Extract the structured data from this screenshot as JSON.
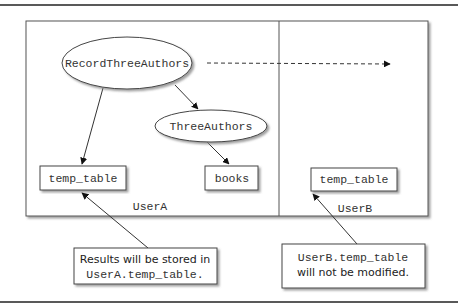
{
  "diagram": {
    "schemas": [
      {
        "id": "userA",
        "label": "UserA"
      },
      {
        "id": "userB",
        "label": "UserB"
      }
    ],
    "procedures": [
      {
        "id": "record",
        "label": "RecordThreeAuthors"
      },
      {
        "id": "three",
        "label": "ThreeAuthors"
      }
    ],
    "tables": [
      {
        "id": "tempA",
        "label": "temp_table",
        "schema": "UserA"
      },
      {
        "id": "books",
        "label": "books",
        "schema": "UserA"
      },
      {
        "id": "tempB",
        "label": "temp_table",
        "schema": "UserB"
      }
    ],
    "edges": [
      {
        "from": "RecordThreeAuthors",
        "to": "temp_table (UserA)",
        "style": "solid"
      },
      {
        "from": "RecordThreeAuthors",
        "to": "ThreeAuthors",
        "style": "solid"
      },
      {
        "from": "ThreeAuthors",
        "to": "books",
        "style": "solid"
      },
      {
        "from": "RecordThreeAuthors",
        "to": "UserB",
        "style": "dashed"
      }
    ],
    "callouts": [
      {
        "id": "calloutA",
        "line1": "Results will be stored in",
        "line2": "UserA.temp_table."
      },
      {
        "id": "calloutB",
        "line1": "UserB.temp_table",
        "line2": "will not be modified."
      }
    ]
  }
}
